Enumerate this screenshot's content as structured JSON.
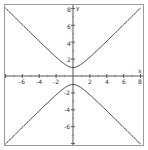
{
  "chart_data": {
    "type": "line",
    "title": "",
    "xlabel": "x",
    "ylabel": "y",
    "xlim": [
      -8,
      8
    ],
    "ylim": [
      -8,
      8
    ],
    "grid": false,
    "equation": "y^2 - x^2 = 1",
    "x_ticks": [
      -6,
      -4,
      -2,
      2,
      4,
      6,
      8
    ],
    "y_ticks": [
      8,
      6,
      4,
      2,
      -2,
      -4,
      -6
    ],
    "series": [
      {
        "name": "upper branch",
        "x": [
          -8,
          -6,
          -4,
          -2,
          -1,
          0,
          1,
          2,
          4,
          6,
          8
        ],
        "y": [
          8.06,
          6.08,
          4.12,
          2.24,
          1.41,
          1,
          1.41,
          2.24,
          4.12,
          6.08,
          8.06
        ]
      },
      {
        "name": "lower branch",
        "x": [
          -8,
          -6,
          -4,
          -2,
          -1,
          0,
          1,
          2,
          4,
          6,
          8
        ],
        "y": [
          -8.06,
          -6.08,
          -4.12,
          -2.24,
          -1.41,
          -1,
          -1.41,
          -2.24,
          -4.12,
          -6.08,
          -8.06
        ]
      }
    ],
    "colors": {
      "curve": "#3c3c3c",
      "axis": "#555555",
      "frame": "#9a9a9a"
    }
  },
  "labels": {
    "x_axis": "x",
    "y_axis": "y",
    "x_ticks": [
      "-6",
      "-4",
      "-2",
      "2",
      "4",
      "6",
      "8"
    ],
    "y_ticks": [
      "8",
      "6",
      "4",
      "2",
      "-2",
      "-4",
      "-6"
    ]
  }
}
